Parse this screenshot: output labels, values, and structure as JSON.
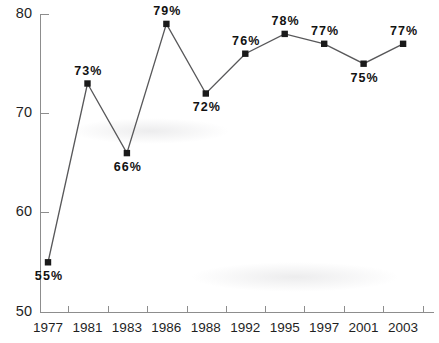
{
  "chart_data": {
    "type": "line",
    "title": "",
    "subtitle": "",
    "xlabel": "",
    "ylabel": "",
    "categories": [
      "1977",
      "1981",
      "1983",
      "1986",
      "1988",
      "1992",
      "1995",
      "1997",
      "2001",
      "2003"
    ],
    "values": [
      55,
      73,
      66,
      79,
      72,
      76,
      78,
      77,
      75,
      77
    ],
    "point_labels": [
      "55%",
      "73%",
      "66%",
      "79%",
      "72%",
      "76%",
      "78%",
      "77%",
      "75%",
      "77%"
    ],
    "label_positions": [
      "below",
      "above",
      "below",
      "above",
      "below",
      "above",
      "above",
      "above",
      "below",
      "above"
    ],
    "ylim": [
      50,
      80
    ],
    "xlim_categories": 10,
    "yticks": [
      50,
      60,
      70,
      80
    ],
    "ytick_labels": [
      "50",
      "60",
      "70",
      "80"
    ],
    "grid": false,
    "legend": null,
    "legend_position": "none",
    "marker": "square",
    "series": [
      {
        "name": "",
        "values": [
          55,
          73,
          66,
          79,
          72,
          76,
          78,
          77,
          75,
          77
        ]
      }
    ],
    "colors": {
      "line": "#58585a",
      "marker": "#1a1a1a",
      "axis": "#8d8d8d",
      "text": "#1f1f1f",
      "background": "#ffffff"
    }
  }
}
